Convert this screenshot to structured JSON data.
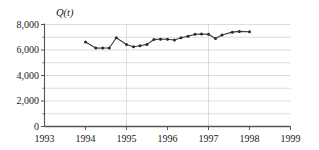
{
  "chart_data": {
    "type": "line",
    "title": "",
    "subtitle": "",
    "axis_title": "Q(t)",
    "xlabel": "",
    "ylabel": "",
    "xlim": [
      1993,
      1999
    ],
    "ylim": [
      0,
      8000
    ],
    "grid": true,
    "legend_position": "none",
    "y_ticks": [
      "0",
      "2,000",
      "4,000",
      "6,000",
      "8,000"
    ],
    "y_tick_values": [
      0,
      2000,
      4000,
      6000,
      8000
    ],
    "y_minor_tick_values": [
      1000,
      3000,
      5000,
      7000
    ],
    "x_ticks": [
      "1993",
      "1994",
      "1995",
      "1996",
      "1997",
      "1998",
      "1999"
    ],
    "x_tick_values": [
      1993,
      1994,
      1995,
      1996,
      1997,
      1998,
      1999
    ],
    "vertical_gridlines": [
      1995,
      1997
    ],
    "marker": "circle",
    "line_color": "#3a3a3a",
    "marker_color": "#2b2b2b",
    "grid_color": "#c8c8c8",
    "axis_color": "#555555",
    "series": [
      {
        "name": "Q(t)",
        "x": [
          1994.0,
          1994.25,
          1994.42,
          1994.58,
          1994.75,
          1995.0,
          1995.17,
          1995.33,
          1995.5,
          1995.67,
          1995.83,
          1996.0,
          1996.17,
          1996.33,
          1996.5,
          1996.67,
          1996.83,
          1997.0,
          1997.17,
          1997.33,
          1997.58,
          1997.75,
          1998.0
        ],
        "values": [
          6620,
          6150,
          6160,
          6160,
          6960,
          6430,
          6260,
          6330,
          6440,
          6820,
          6850,
          6840,
          6790,
          6960,
          7080,
          7240,
          7250,
          7240,
          6900,
          7180,
          7400,
          7460,
          7430
        ]
      }
    ]
  },
  "axes": {
    "y_axis_name": "value-axis",
    "x_axis_name": "year-axis"
  }
}
